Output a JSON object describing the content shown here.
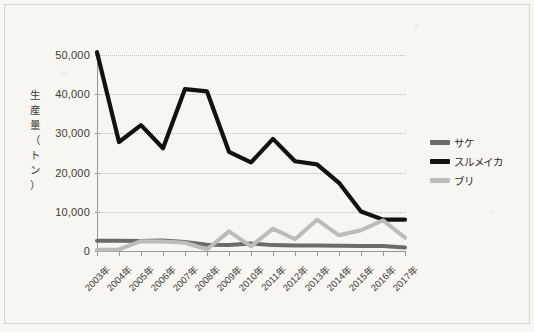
{
  "chart_data": {
    "type": "line",
    "title": "",
    "xlabel": "",
    "ylabel": "生産量（トン）",
    "ylabel_chars": [
      "生",
      "産",
      "量",
      "（",
      "ト",
      "ン",
      "）"
    ],
    "categories": [
      "2003年",
      "2004年",
      "2005年",
      "2006年",
      "2007年",
      "2008年",
      "2009年",
      "2010年",
      "2011年",
      "2012年",
      "2013年",
      "2014年",
      "2015年",
      "2016年",
      "2017年"
    ],
    "ylim": [
      0,
      50000
    ],
    "ytick_labels": [
      "50,000",
      "40,000",
      "30,000",
      "20,000",
      "10,000",
      "0"
    ],
    "ytick_values": [
      50000,
      40000,
      30000,
      20000,
      10000,
      0
    ],
    "grid": true,
    "grid_style": "dotted-horizontal",
    "legend_position": "right",
    "series": [
      {
        "name": "サケ",
        "color": "#6b6b68",
        "values": [
          2600,
          2600,
          2550,
          2700,
          2300,
          1600,
          1550,
          1900,
          1500,
          1400,
          1400,
          1350,
          1300,
          1250,
          900
        ]
      },
      {
        "name": "スルメイカ",
        "color": "#14120f",
        "values": [
          50700,
          27800,
          32100,
          26200,
          41300,
          40700,
          25300,
          22600,
          28600,
          22900,
          22100,
          17400,
          10100,
          8000,
          8000
        ]
      },
      {
        "name": "ブリ",
        "color": "#bcbcb8",
        "values": [
          300,
          400,
          2500,
          2400,
          2100,
          400,
          5000,
          1200,
          5700,
          3000,
          8000,
          4000,
          5300,
          7800,
          3400
        ]
      }
    ]
  },
  "legend": {
    "items": [
      {
        "label": "サケ",
        "color": "#6b6b68"
      },
      {
        "label": "スルメイカ",
        "color": "#14120f"
      },
      {
        "label": "ブリ",
        "color": "#bcbcb8"
      }
    ]
  }
}
